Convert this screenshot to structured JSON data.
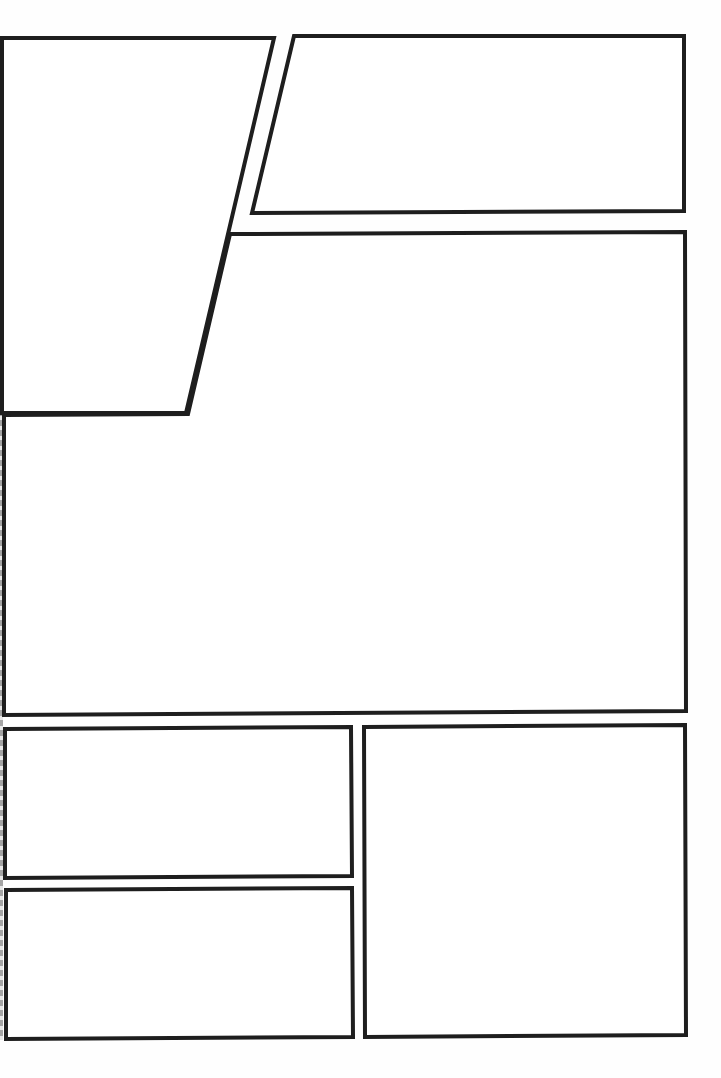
{
  "page": {
    "type": "comic-panel-template",
    "background": "#ffffff",
    "border_color": "#1e1e1e",
    "panels": [
      {
        "id": "panel-1",
        "points": "2,38 274,38 186,413 2,413"
      },
      {
        "id": "panel-2",
        "points": "294,36 684,36 684,211 252,213"
      },
      {
        "id": "panel-3",
        "points": "230,234 685,232 686,711 4,715 4,415 188,414"
      },
      {
        "id": "panel-4",
        "points": "5,729 351,727 352,876 5,878"
      },
      {
        "id": "panel-5",
        "points": "6,890 352,888 353,1037 6,1039"
      },
      {
        "id": "panel-6",
        "points": "364,727 685,725 686,1035 365,1037"
      }
    ]
  }
}
